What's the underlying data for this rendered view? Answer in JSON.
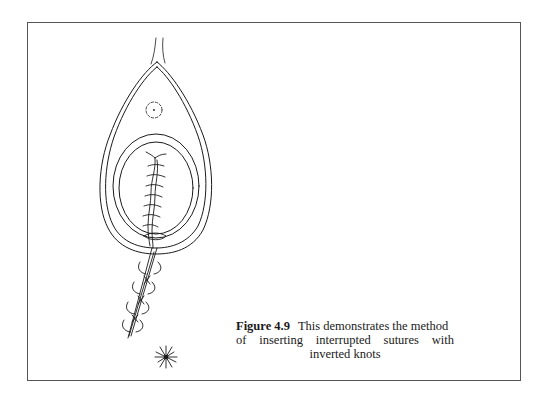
{
  "figure": {
    "label": "Figure 4.9",
    "caption_lines": [
      "This demonstrates the method",
      "of inserting interrupted sutures with",
      "inverted knots"
    ],
    "full_caption": "This demonstrates the method of inserting interrupted sutures with inverted knots",
    "illustration": {
      "subject": "interrupted-sutures-with-inverted-knots",
      "elements": [
        "teardrop-outer-outline",
        "teardrop-inner-outline",
        "dashed-circle",
        "oval-outer",
        "oval-inner",
        "sutured-incision",
        "suture-needle-tail",
        "knot-starburst"
      ]
    }
  },
  "colors": {
    "ink": "#1a1a1a",
    "frame": "#555555",
    "background": "#ffffff"
  }
}
